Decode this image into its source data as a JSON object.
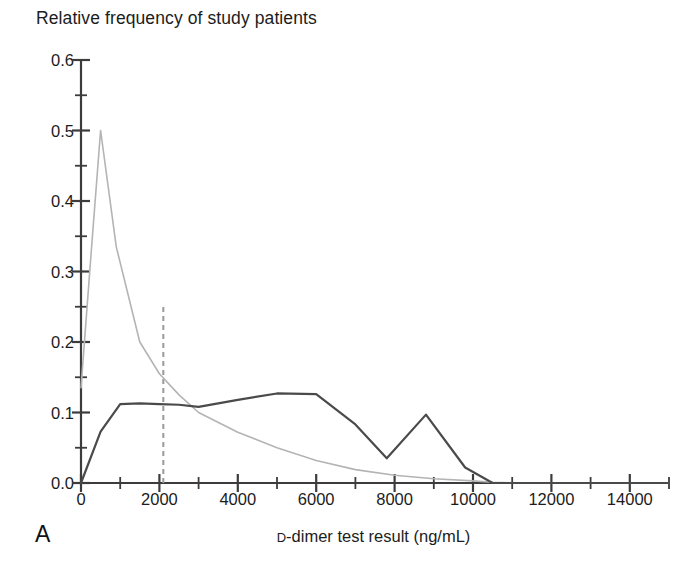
{
  "figure": {
    "title": "Relative frequency of study patients",
    "panel_label": "A",
    "xlabel_prefix": "D",
    "xlabel_rest": "-dimer test result (ng/mL)",
    "xlabel_full": "D-dimer test result (ng/mL)"
  },
  "colors": {
    "axis": "#3c3c3c",
    "series_dark": "#4a4a4a",
    "series_light": "#b4b4b4",
    "threshold_line": "#9a9a9a",
    "text": "#1c1c1c",
    "background": "#ffffff"
  },
  "chart_data": {
    "type": "line",
    "title": "Relative frequency of study patients",
    "xlabel": "D-dimer test result (ng/mL)",
    "ylabel": "Relative frequency of study patients",
    "xlim": [
      0,
      15000
    ],
    "ylim": [
      0.0,
      0.6
    ],
    "grid": false,
    "legend": "none",
    "x_major_ticks": [
      0,
      2000,
      4000,
      6000,
      8000,
      10000,
      12000,
      14000
    ],
    "x_tick_labels": [
      "0",
      "2000",
      "4000",
      "6000",
      "8000",
      "10000",
      "12000",
      "14000"
    ],
    "x_minor_tick_interval": 1000,
    "y_major_ticks": [
      0.0,
      0.1,
      0.2,
      0.3,
      0.4,
      0.5,
      0.6
    ],
    "y_tick_labels": [
      "0.0",
      "0.1",
      "0.2",
      "0.3",
      "0.4",
      "0.5",
      "0.6"
    ],
    "y_minor_tick_interval": 0.05,
    "annotations": [
      {
        "name": "threshold-line",
        "style": "dashed-vertical",
        "x": 2100,
        "y_from": 0.0,
        "y_to": 0.25,
        "color": "#9a9a9a"
      }
    ],
    "series": [
      {
        "name": "light-gray-curve",
        "color": "#b4b4b4",
        "width": 1.6,
        "x": [
          0,
          250,
          500,
          900,
          1500,
          2000,
          2500,
          3000,
          4000,
          5000,
          6000,
          7000,
          8000,
          9000,
          10000,
          10500,
          11000,
          12000,
          15000
        ],
        "values": [
          0.135,
          0.32,
          0.5,
          0.335,
          0.2,
          0.155,
          0.125,
          0.1,
          0.072,
          0.05,
          0.032,
          0.019,
          0.011,
          0.006,
          0.003,
          0.001,
          0.0,
          0.0,
          0.0
        ]
      },
      {
        "name": "dark-gray-curve",
        "color": "#4a4a4a",
        "width": 2.2,
        "x": [
          0,
          500,
          1000,
          1500,
          2000,
          2500,
          3000,
          4000,
          5000,
          6000,
          7000,
          7800,
          8800,
          9800,
          10500,
          11000,
          15000
        ],
        "values": [
          0.0,
          0.073,
          0.112,
          0.113,
          0.112,
          0.111,
          0.108,
          0.118,
          0.127,
          0.126,
          0.083,
          0.035,
          0.097,
          0.022,
          0.0,
          0.0,
          0.0
        ]
      }
    ]
  }
}
